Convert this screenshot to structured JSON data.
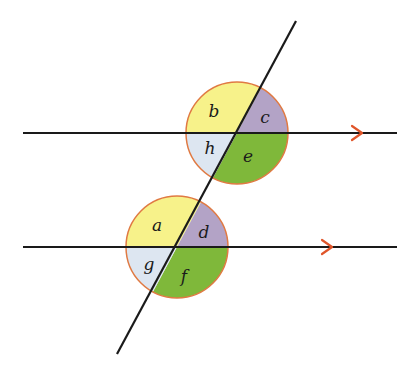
{
  "diagram": {
    "colors": {
      "yellow": "#f7f28a",
      "purple": "#b3a3c6",
      "lightblue": "#dde6f1",
      "green": "#7fb83a",
      "circle_stroke": "#e07a43",
      "arrow": "#e0552a",
      "line": "#1a1a1a"
    },
    "upper_intersection": {
      "angles": {
        "top_left": "b",
        "top_right": "c",
        "bottom_left": "h",
        "bottom_right": "e"
      }
    },
    "lower_intersection": {
      "angles": {
        "top_left": "a",
        "top_right": "d",
        "bottom_left": "g",
        "bottom_right": "f"
      }
    },
    "arrow_markers": [
      "parallel-arrow-upper",
      "parallel-arrow-lower"
    ]
  }
}
